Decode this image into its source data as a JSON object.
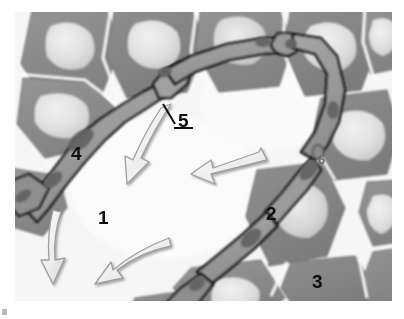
{
  "figure": {
    "kind": "light-microscopy-histology-micrograph",
    "modality": "grayscale brightfield section",
    "canvas": {
      "width": 404,
      "height": 319,
      "background": "#ffffff"
    },
    "image_frame": {
      "x": 15,
      "y": 12,
      "width": 377,
      "height": 289
    },
    "palette": {
      "cell_cytoplasm": "#8d8d8d",
      "cell_cytoplasm_dark": "#7b7b7b",
      "cell_nucleus": "#dcdcdc",
      "cell_nucleus_bright": "#ececec",
      "interstitium": "#f4f4f4",
      "background_lumen": "#fbfbfb",
      "capillary_wall_outline": "#161616",
      "capillary_lumen": "#9a9a9a",
      "endothelial_nucleus": "#6a6a6a",
      "arrow_fill": "#f2f2f2",
      "arrow_outline": "#a8a8a8",
      "label_text": "#0d0d0d",
      "label_text_faint": "#6e6e6e"
    }
  },
  "labels": [
    {
      "id": "label-1",
      "text": "1",
      "x": 98,
      "y": 208,
      "size": 19,
      "tone": "dark",
      "points_to": "interstitial-space",
      "leader": false
    },
    {
      "id": "label-2",
      "text": "2",
      "x": 266,
      "y": 204,
      "size": 19,
      "tone": "dark",
      "points_to": "large-cell-with-pale-nucleus",
      "leader": false
    },
    {
      "id": "label-3",
      "text": "3",
      "x": 312,
      "y": 272,
      "size": 19,
      "tone": "dark",
      "points_to": "cell-boundary-junction",
      "leader": false
    },
    {
      "id": "label-4",
      "text": "4",
      "x": 71,
      "y": 144,
      "size": 19,
      "tone": "dark",
      "points_to": "capillary-segment-left",
      "leader": false
    },
    {
      "id": "label-5",
      "text": "5",
      "x": 178,
      "y": 111,
      "size": 19,
      "tone": "dark",
      "points_to": "capillary-wall-branch-point",
      "leader": true,
      "leader_line": {
        "x1": 175,
        "y1": 122,
        "x2": 163,
        "y2": 103
      },
      "underline": {
        "x1": 174,
        "y1": 127,
        "x2": 192,
        "y2": 127
      }
    },
    {
      "id": "label-6",
      "text": "6",
      "x": 318,
      "y": 153,
      "size": 13,
      "tone": "faint",
      "points_to": "small-dense-nucleus-between-cells",
      "leader": false
    }
  ],
  "arrows": [
    {
      "id": "arrow-1",
      "style": "curved-outline",
      "direction": "down-left",
      "from": {
        "x": 167,
        "y": 110
      },
      "to": {
        "x": 126,
        "y": 184
      }
    },
    {
      "id": "arrow-2",
      "style": "straight-outline",
      "direction": "left",
      "from": {
        "x": 259,
        "y": 153
      },
      "to": {
        "x": 196,
        "y": 176
      }
    },
    {
      "id": "arrow-3",
      "style": "curved-outline",
      "direction": "down",
      "from": {
        "x": 56,
        "y": 220
      },
      "to": {
        "x": 48,
        "y": 265
      }
    },
    {
      "id": "arrow-4",
      "style": "curved-outline",
      "direction": "down-left",
      "from": {
        "x": 170,
        "y": 250
      },
      "to": {
        "x": 99,
        "y": 281
      }
    }
  ],
  "cells": [
    {
      "id": "cell-tl-1",
      "cx": 72,
      "cy": 47,
      "nucleus": true
    },
    {
      "id": "cell-tl-2",
      "cx": 158,
      "cy": 44,
      "nucleus": true
    },
    {
      "id": "cell-tm-1",
      "cx": 243,
      "cy": 40,
      "nucleus": true
    },
    {
      "id": "cell-tr-1",
      "cx": 320,
      "cy": 48,
      "nucleus": true
    },
    {
      "id": "cell-tr-2",
      "cx": 384,
      "cy": 36,
      "nucleus": true
    },
    {
      "id": "cell-ml-1",
      "cx": 68,
      "cy": 110,
      "nucleus": true
    },
    {
      "id": "cell-mr-1",
      "cx": 352,
      "cy": 118,
      "nucleus": true
    },
    {
      "id": "cell-mr-2",
      "cx": 392,
      "cy": 185,
      "nucleus": true
    },
    {
      "id": "cell-c-2",
      "cx": 288,
      "cy": 208,
      "nucleus": true
    },
    {
      "id": "cell-bl-1",
      "cx": 40,
      "cy": 190,
      "nucleus": false
    },
    {
      "id": "cell-bm-1",
      "cx": 232,
      "cy": 283,
      "nucleus": true
    },
    {
      "id": "cell-br-1",
      "cx": 330,
      "cy": 292,
      "nucleus": true
    },
    {
      "id": "cell-bl-2",
      "cx": 170,
      "cy": 298,
      "nucleus": false
    }
  ],
  "capillary_network": {
    "description": "branching capillary with dark endothelial outline running diagonally from lower-left through centre to right margin",
    "branch_points": 4,
    "endothelial_nuclei": 7
  }
}
